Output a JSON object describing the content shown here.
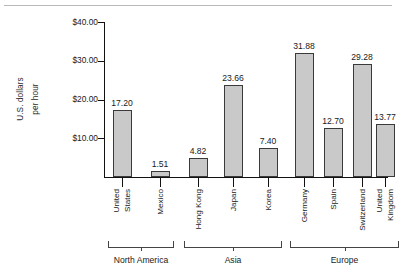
{
  "chart_data": {
    "type": "bar",
    "title": "",
    "xlabel": "",
    "ylabel": "U.S. dollars per hour",
    "ylabel_lines": [
      "U.S. dollars",
      "per hour"
    ],
    "ylim": [
      0,
      40
    ],
    "grid": false,
    "legend": "none",
    "y_ticks": [
      10,
      20,
      30,
      40
    ],
    "y_tick_labels": [
      "$10.00",
      "$20.00",
      "$30.00",
      "$40.00"
    ],
    "categories": [
      "United States",
      "Mexico",
      "Hong Kong",
      "Japan",
      "Korea",
      "Germany",
      "Spain",
      "Switzerland",
      "United Kingdom"
    ],
    "category_lines": [
      [
        "United",
        "States"
      ],
      [
        "Mexico"
      ],
      [
        "Hong Kong"
      ],
      [
        "Japan"
      ],
      [
        "Korea"
      ],
      [
        "Germany"
      ],
      [
        "Spain"
      ],
      [
        "Switzerland"
      ],
      [
        "United",
        "Kingdom"
      ]
    ],
    "values": [
      17.2,
      1.51,
      4.82,
      23.66,
      7.4,
      31.88,
      12.7,
      29.28,
      13.77
    ],
    "value_labels": [
      "17.20",
      "1.51",
      "4.82",
      "23.66",
      "7.40",
      "31.88",
      "12.70",
      "29.28",
      "13.77"
    ],
    "groups": [
      {
        "label": "North America",
        "start": 0,
        "end": 1
      },
      {
        "label": "Asia",
        "start": 2,
        "end": 4
      },
      {
        "label": "Europe",
        "start": 5,
        "end": 8
      }
    ],
    "colors": {
      "bar_fill": "#c9c9c9",
      "bar_stroke": "#3a3a3a",
      "axis": "#111111",
      "text": "#1a1a1a",
      "top_rule": "#b9b9b9"
    }
  }
}
